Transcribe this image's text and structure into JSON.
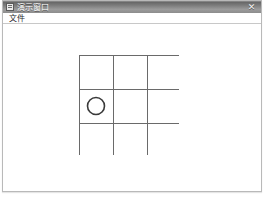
{
  "window": {
    "title": "演示窗口",
    "icon": "window-app-icon",
    "close_label": "✕",
    "close_icon": "close-icon"
  },
  "menubar": {
    "items": [
      {
        "label": "文件",
        "name": "menu-file"
      }
    ]
  },
  "board": {
    "name": "tic-tac-toe-board",
    "rows": 3,
    "cols": 3,
    "line_color": "#6a6a6a",
    "line_width": 1,
    "cell_size": 34,
    "origin_x": 4,
    "origin_y": 4,
    "piece_color": "#3a3a3a",
    "piece_radius": 8.5,
    "cells": [
      {
        "row": 0,
        "col": 0,
        "mark": "",
        "name": "cell-0-0"
      },
      {
        "row": 0,
        "col": 1,
        "mark": "",
        "name": "cell-0-1"
      },
      {
        "row": 0,
        "col": 2,
        "mark": "",
        "name": "cell-0-2"
      },
      {
        "row": 1,
        "col": 0,
        "mark": "O",
        "name": "cell-1-0"
      },
      {
        "row": 1,
        "col": 1,
        "mark": "",
        "name": "cell-1-1"
      },
      {
        "row": 1,
        "col": 2,
        "mark": "",
        "name": "cell-1-2"
      },
      {
        "row": 2,
        "col": 0,
        "mark": "",
        "name": "cell-2-0"
      },
      {
        "row": 2,
        "col": 1,
        "mark": "",
        "name": "cell-2-1"
      },
      {
        "row": 2,
        "col": 2,
        "mark": "",
        "name": "cell-2-2"
      }
    ]
  },
  "colors": {
    "titlebar_dark": "#5f5f5f",
    "titlebar_light": "#9b9b9b",
    "window_border": "#b9b9b9",
    "client_background": "#ffffff",
    "grid_line": "#6a6a6a",
    "menu_text": "#2a2a2a",
    "title_text": "#ffffff"
  }
}
